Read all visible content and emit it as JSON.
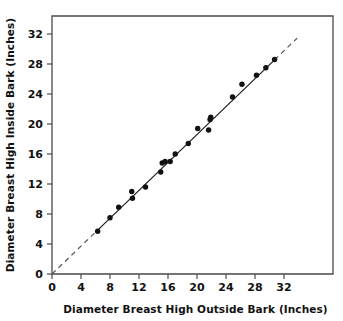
{
  "chart_data": {
    "type": "scatter",
    "title": "",
    "xlabel": "Diameter Breast High Outside Bark (Inches)",
    "ylabel": "Diameter Breast High Inside Bark (Inches)",
    "xlim": [
      0,
      34
    ],
    "ylim": [
      0,
      34
    ],
    "xticks": [
      0,
      4,
      8,
      12,
      16,
      20,
      24,
      28,
      32
    ],
    "yticks": [
      0,
      4,
      8,
      12,
      16,
      20,
      24,
      28,
      32
    ],
    "xticklabels": [
      "0",
      "4",
      "8",
      "12",
      "16",
      "20",
      "24",
      "28",
      "32"
    ],
    "yticklabels": [
      "0",
      "4",
      "8",
      "12",
      "16",
      "20",
      "24",
      "28",
      "32"
    ],
    "grid": false,
    "legend": null,
    "points": [
      {
        "x": 6.3,
        "y": 5.7
      },
      {
        "x": 8.0,
        "y": 7.5
      },
      {
        "x": 9.2,
        "y": 8.9
      },
      {
        "x": 11.0,
        "y": 11.0
      },
      {
        "x": 11.1,
        "y": 10.1
      },
      {
        "x": 12.9,
        "y": 11.6
      },
      {
        "x": 15.0,
        "y": 13.6
      },
      {
        "x": 15.2,
        "y": 14.8
      },
      {
        "x": 15.6,
        "y": 15.0
      },
      {
        "x": 16.3,
        "y": 15.0
      },
      {
        "x": 17.0,
        "y": 16.0
      },
      {
        "x": 18.8,
        "y": 17.4
      },
      {
        "x": 20.1,
        "y": 19.4
      },
      {
        "x": 21.6,
        "y": 19.2
      },
      {
        "x": 21.8,
        "y": 20.6
      },
      {
        "x": 21.9,
        "y": 20.9
      },
      {
        "x": 24.9,
        "y": 23.6
      },
      {
        "x": 26.2,
        "y": 25.3
      },
      {
        "x": 28.2,
        "y": 26.5
      },
      {
        "x": 29.5,
        "y": 27.5
      },
      {
        "x": 30.7,
        "y": 28.6
      }
    ],
    "reference_line": {
      "style": "solid-with-dashed-extensions",
      "slope": 0.93,
      "intercept": 0.0,
      "solid_from_x": 6.3,
      "solid_to_x": 30.7,
      "dashed_from_x": 0.0,
      "dashed_to_x": 33.8
    }
  },
  "axes": {
    "x_title": "Diameter Breast High Outside Bark (Inches)",
    "y_title": "Diameter Breast High Inside Bark (Inches)"
  }
}
